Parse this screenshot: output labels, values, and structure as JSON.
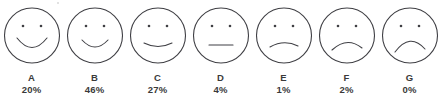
{
  "chart_data": {
    "type": "bar",
    "title": "",
    "subtitle": "",
    "xlabel": "",
    "ylabel": "",
    "grid": false,
    "legend": null,
    "scale_kind": "smiley-face rating scale",
    "categories": [
      "A",
      "B",
      "C",
      "D",
      "E",
      "F",
      "G"
    ],
    "values": [
      20,
      46,
      27,
      4,
      1,
      2,
      0
    ],
    "value_labels": [
      "20%",
      "46%",
      "27%",
      "4%",
      "1%",
      "2%",
      "0%"
    ],
    "unit": "%",
    "ylim": [
      0,
      100
    ],
    "annotations": []
  },
  "style": {
    "stroke_color": "#3f3f44",
    "text_color": "#3a3a3a",
    "background": "#ffffff",
    "stroke_width": 1.1
  },
  "faces": [
    {
      "id": "face-a",
      "letter": "A",
      "percent": "20%",
      "expression": "big-smile",
      "icon": "smiley-very-happy-icon",
      "mouth_path": "M 13 32 Q 28 51 43 32"
    },
    {
      "id": "face-b",
      "letter": "B",
      "percent": "46%",
      "expression": "smile",
      "icon": "smiley-happy-icon",
      "mouth_path": "M 15 34 Q 28 48 41 34"
    },
    {
      "id": "face-c",
      "letter": "C",
      "percent": "27%",
      "expression": "slight-smile",
      "icon": "smiley-slightly-happy-icon",
      "mouth_path": "M 14 37 Q 28 44 42 37"
    },
    {
      "id": "face-d",
      "letter": "D",
      "percent": "4%",
      "expression": "neutral",
      "icon": "smiley-neutral-icon",
      "mouth_path": "M 16 39 L 40 39"
    },
    {
      "id": "face-e",
      "letter": "E",
      "percent": "1%",
      "expression": "slight-frown",
      "icon": "smiley-slightly-sad-icon",
      "mouth_path": "M 14 41 Q 28 33 42 40"
    },
    {
      "id": "face-f",
      "letter": "F",
      "percent": "2%",
      "expression": "frown",
      "icon": "smiley-sad-icon",
      "mouth_path": "M 13 44 Q 28 30 43 42"
    },
    {
      "id": "face-g",
      "letter": "G",
      "percent": "0%",
      "expression": "deep-frown",
      "icon": "smiley-very-sad-icon",
      "mouth_path": "M 13 46 Q 28 26 43 43"
    }
  ],
  "geometry": {
    "circle_cx": 28,
    "circle_cy": 29.5,
    "circle_r": 27.5,
    "eye_left_cx": 19,
    "eye_right_cx": 37,
    "eye_cy": 20,
    "eye_r": 1.3,
    "pitch": 63
  }
}
